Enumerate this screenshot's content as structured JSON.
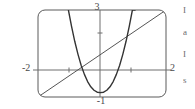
{
  "figure": {
    "name": "graphing-calculator-plot",
    "frame": {
      "x_left": 38,
      "x_right": 166,
      "y_top": 10,
      "y_bottom": 97,
      "corner_radius": 6,
      "stroke": "#555555"
    },
    "axes": {
      "x_axis_y_px": 70,
      "y_axis_x_px": 100,
      "stroke": "#777777",
      "x_ticks_px": [
        69,
        131
      ],
      "y_ticks_px": [
        33
      ]
    },
    "labels": {
      "y_max": "3",
      "y_min": "-1",
      "x_min": "-2",
      "x_max": "2"
    },
    "margin_notes": [
      "I",
      "a",
      "I",
      "s"
    ]
  },
  "chart_data": {
    "type": "line",
    "title": "",
    "xlabel": "",
    "ylabel": "",
    "xlim": [
      -2,
      2
    ],
    "ylim": [
      -1,
      3
    ],
    "grid": false,
    "legend": "none",
    "xticks": [
      -2,
      2
    ],
    "yticks": [
      -1,
      3
    ],
    "series": [
      {
        "name": "parabola",
        "color": "#3a3a3a",
        "description": "upward-opening parabola with vertex slightly below the x-axis near x = 0",
        "x": [
          -1.05,
          -0.95,
          -0.85,
          -0.75,
          -0.65,
          -0.55,
          -0.45,
          -0.35,
          -0.25,
          -0.15,
          -0.05,
          0.05,
          0.15,
          0.25,
          0.35,
          0.45,
          0.55,
          0.65,
          0.75,
          0.85,
          0.95,
          1.05
        ],
        "y": [
          3.0,
          2.24,
          1.55,
          0.96,
          0.45,
          0.04,
          -0.29,
          -0.53,
          -0.69,
          -0.78,
          -0.8,
          -0.78,
          -0.69,
          -0.53,
          -0.29,
          0.04,
          0.45,
          0.96,
          1.55,
          2.24,
          3.0,
          3.0
        ]
      },
      {
        "name": "diagonal-line",
        "color": "#555555",
        "description": "straight line rising left to right from lower-left corner to upper-right corner",
        "x": [
          -2,
          2
        ],
        "y": [
          -1,
          3
        ]
      }
    ]
  }
}
